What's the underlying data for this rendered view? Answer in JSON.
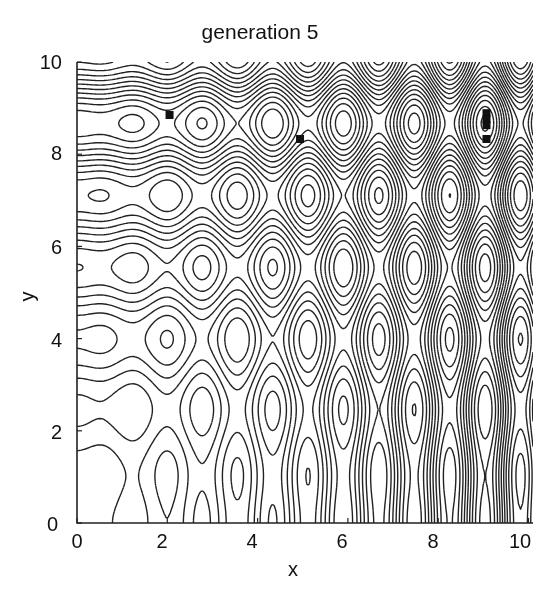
{
  "chart_data": {
    "type": "contour",
    "title": "generation 5",
    "xlabel": "x",
    "ylabel": "y",
    "xlim": [
      0,
      10.1
    ],
    "ylim": [
      0,
      10
    ],
    "xticks": [
      0,
      2,
      4,
      6,
      8,
      10
    ],
    "yticks": [
      0,
      2,
      4,
      6,
      8,
      10
    ],
    "xtick_labels": [
      "0",
      "2",
      "4",
      "6",
      "8",
      "10"
    ],
    "ytick_labels": [
      "0",
      "2",
      "4",
      "6",
      "8",
      "10"
    ],
    "grid": false,
    "surface": {
      "expression": "x*sin(4*x) + 1.1*y*sin(2*y)",
      "levels": [
        -18,
        -16,
        -14,
        -12,
        -10,
        -8,
        -6,
        -4,
        -2,
        0,
        2,
        4,
        6,
        8,
        10,
        12,
        14,
        16,
        18
      ]
    },
    "population_points": {
      "name": "generation 5 individuals",
      "marker": "square",
      "color": "#111111",
      "points": [
        {
          "x": 2.05,
          "y": 8.85
        },
        {
          "x": 4.94,
          "y": 8.33
        },
        {
          "x": 9.07,
          "y": 8.89
        },
        {
          "x": 9.07,
          "y": 8.76
        },
        {
          "x": 9.07,
          "y": 8.63
        },
        {
          "x": 9.07,
          "y": 8.33
        }
      ]
    },
    "colors": {
      "contour": "#222222",
      "axis": "#222222",
      "background": "#ffffff"
    }
  },
  "labels": {
    "title": "generation 5",
    "xlabel": "x",
    "ylabel": "y",
    "x0": "0",
    "x2": "2",
    "x4": "4",
    "x6": "6",
    "x8": "8",
    "x10": "10",
    "y0": "0",
    "y2": "2",
    "y4": "4",
    "y6": "6",
    "y8": "8",
    "y10": "10"
  }
}
